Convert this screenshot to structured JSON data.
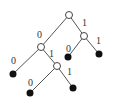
{
  "diagram": {
    "type": "binary-tree",
    "nodes": [
      {
        "id": "root",
        "kind": "internal",
        "x": 69,
        "y": 15
      },
      {
        "id": "r",
        "kind": "internal",
        "x": 84,
        "y": 36
      },
      {
        "id": "l",
        "kind": "internal",
        "x": 41,
        "y": 47
      },
      {
        "id": "r0",
        "kind": "leaf",
        "x": 68,
        "y": 57
      },
      {
        "id": "r1",
        "kind": "leaf",
        "x": 99,
        "y": 54
      },
      {
        "id": "l0",
        "kind": "leaf",
        "x": 13,
        "y": 74
      },
      {
        "id": "l1",
        "kind": "internal",
        "x": 57,
        "y": 66
      },
      {
        "id": "l10",
        "kind": "leaf",
        "x": 30,
        "y": 93
      },
      {
        "id": "l11",
        "kind": "leaf",
        "x": 73,
        "y": 88
      }
    ],
    "edges": [
      {
        "from": "root",
        "to": "l",
        "label": "0",
        "lx": 37,
        "ly": 38
      },
      {
        "from": "root",
        "to": "r",
        "label": "1",
        "lx": 82,
        "ly": 26
      },
      {
        "from": "r",
        "to": "r0",
        "label": "0",
        "lx": 66,
        "ly": 52
      },
      {
        "from": "r",
        "to": "r1",
        "label": "1",
        "lx": 96,
        "ly": 44
      },
      {
        "from": "l",
        "to": "l0",
        "label": "0",
        "lx": 11,
        "ly": 64
      },
      {
        "from": "l",
        "to": "l1",
        "label": "1",
        "lx": 49,
        "ly": 57
      },
      {
        "from": "l1",
        "to": "l10",
        "label": "0",
        "lx": 28,
        "ly": 86
      },
      {
        "from": "l1",
        "to": "l11",
        "label": "1",
        "lx": 67,
        "ly": 75
      }
    ]
  }
}
